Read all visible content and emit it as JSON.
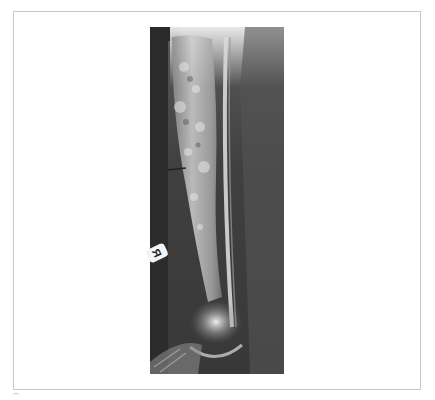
{
  "figure": {
    "type": "radiograph",
    "side_marker": "R",
    "frame_color": "#c8c8c8",
    "background_color": "#ffffff"
  }
}
